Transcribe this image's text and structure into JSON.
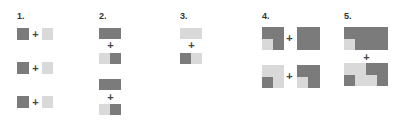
{
  "colors": {
    "dark": "#7b7b7b",
    "light": "#d9d9d9"
  },
  "sections": [
    {
      "label": "1."
    },
    {
      "label": "2."
    },
    {
      "label": "3."
    },
    {
      "label": "4."
    },
    {
      "label": "5."
    }
  ],
  "operator": "+"
}
